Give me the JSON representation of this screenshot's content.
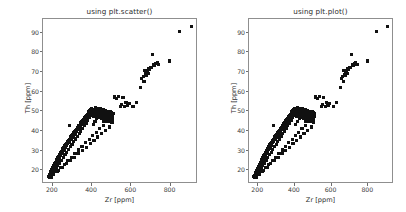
{
  "figure": {
    "background_color": "#ffffff",
    "width": 406,
    "height": 212
  },
  "panels": [
    {
      "id": "left",
      "title": "using plt.scatter()",
      "xlabel": "Zr [ppm]",
      "ylabel": "Th [ppm]"
    },
    {
      "id": "right",
      "title": "using plt.plot()",
      "xlabel": "Zr [ppm]",
      "ylabel": "Th [ppm]"
    }
  ],
  "chart_data": {
    "type": "scatter",
    "title": "using plt.scatter()",
    "xlabel": "Zr [ppm]",
    "ylabel": "Th [ppm]",
    "xlim": [
      150,
      940
    ],
    "ylim": [
      13,
      97
    ],
    "xticks": [
      200,
      400,
      600,
      800
    ],
    "yticks": [
      20,
      30,
      40,
      50,
      60,
      70,
      80,
      90
    ],
    "grid": false,
    "legend": null,
    "marker": "square",
    "marker_color": "#111111",
    "marker_size": 3.1,
    "series": [
      {
        "name": "Th vs Zr",
        "x": [
          182,
          186,
          188,
          190,
          192,
          193,
          195,
          196,
          198,
          199,
          200,
          201,
          203,
          204,
          205,
          206,
          208,
          209,
          210,
          211,
          212,
          214,
          215,
          216,
          218,
          219,
          220,
          222,
          223,
          225,
          226,
          228,
          229,
          231,
          232,
          234,
          235,
          237,
          238,
          240,
          242,
          243,
          245,
          246,
          248,
          250,
          251,
          253,
          255,
          256,
          258,
          260,
          262,
          263,
          265,
          267,
          269,
          270,
          272,
          274,
          276,
          278,
          280,
          282,
          284,
          286,
          288,
          290,
          291,
          293,
          295,
          297,
          299,
          301,
          303,
          305,
          307,
          309,
          311,
          313,
          315,
          317,
          319,
          321,
          323,
          325,
          327,
          329,
          331,
          333,
          335,
          337,
          339,
          341,
          343,
          345,
          347,
          349,
          351,
          353,
          355,
          357,
          359,
          361,
          363,
          365,
          367,
          369,
          371,
          373,
          375,
          377,
          379,
          381,
          383,
          385,
          387,
          389,
          391,
          393,
          395,
          397,
          399,
          401,
          403,
          405,
          407,
          409,
          411,
          413,
          415,
          417,
          419,
          421,
          423,
          425,
          427,
          429,
          431,
          433,
          435,
          437,
          439,
          441,
          443,
          445,
          447,
          449,
          451,
          453,
          455,
          457,
          459,
          461,
          463,
          465,
          467,
          469,
          471,
          473,
          475,
          477,
          479,
          481,
          483,
          485,
          487,
          489,
          491,
          493,
          495,
          497,
          499,
          501,
          503,
          505,
          507,
          509,
          511,
          513,
          196,
          205,
          214,
          222,
          231,
          240,
          249,
          258,
          267,
          276,
          285,
          294,
          303,
          312,
          321,
          330,
          339,
          348,
          357,
          366,
          375,
          384,
          393,
          402,
          411,
          420,
          429,
          438,
          447,
          456,
          465,
          474,
          483,
          492,
          501,
          210,
          228,
          246,
          264,
          282,
          300,
          318,
          336,
          354,
          372,
          390,
          408,
          426,
          444,
          462,
          480,
          498,
          235,
          255,
          275,
          295,
          315,
          335,
          355,
          375,
          395,
          415,
          435,
          455,
          475,
          495,
          290,
          519,
          530,
          541,
          548,
          556,
          563,
          571,
          578,
          586,
          596,
          614,
          631,
          652,
          659,
          667,
          670,
          673,
          676,
          679,
          682,
          686,
          690,
          694,
          698,
          702,
          706,
          712,
          718,
          724,
          731,
          737,
          744,
          800,
          850,
          912
        ],
        "y": [
          16.2,
          16.8,
          15.9,
          17.4,
          16.5,
          18.1,
          17.0,
          18.6,
          17.8,
          19.2,
          18.4,
          19.8,
          18.9,
          20.3,
          19.5,
          20.9,
          20.1,
          21.4,
          20.6,
          22.0,
          21.2,
          22.5,
          21.8,
          23.1,
          22.3,
          23.6,
          22.9,
          24.2,
          23.4,
          24.7,
          24.0,
          25.3,
          24.5,
          25.8,
          25.1,
          26.4,
          25.6,
          27.0,
          26.2,
          27.5,
          26.8,
          28.1,
          27.3,
          28.6,
          27.9,
          29.2,
          28.4,
          29.7,
          29.0,
          30.3,
          29.5,
          30.8,
          30.1,
          31.4,
          30.6,
          32.0,
          31.2,
          32.5,
          31.8,
          33.1,
          32.3,
          33.6,
          32.9,
          34.2,
          33.4,
          34.7,
          34.0,
          35.3,
          34.5,
          35.8,
          35.1,
          36.4,
          35.6,
          37.0,
          36.2,
          37.5,
          36.8,
          38.1,
          37.3,
          38.6,
          37.9,
          39.2,
          38.4,
          39.7,
          39.0,
          40.3,
          39.5,
          40.8,
          40.1,
          41.4,
          40.6,
          42.0,
          41.2,
          42.5,
          41.8,
          43.1,
          42.3,
          43.6,
          42.9,
          44.2,
          43.4,
          44.7,
          44.0,
          45.3,
          44.5,
          45.8,
          45.1,
          46.4,
          45.6,
          47.0,
          46.2,
          47.5,
          46.8,
          48.1,
          47.3,
          48.6,
          47.9,
          49.2,
          48.4,
          49.7,
          49.0,
          50.3,
          49.5,
          50.8,
          48.2,
          49.4,
          50.1,
          47.6,
          48.8,
          50.6,
          46.9,
          48.3,
          49.9,
          51.2,
          47.4,
          48.9,
          50.4,
          46.6,
          48.0,
          49.6,
          51.0,
          47.1,
          48.5,
          50.0,
          46.3,
          47.8,
          49.3,
          50.9,
          46.0,
          47.5,
          49.0,
          50.5,
          45.7,
          47.2,
          48.7,
          50.2,
          45.4,
          46.9,
          48.4,
          49.9,
          45.1,
          46.6,
          48.1,
          49.6,
          44.8,
          46.3,
          47.8,
          49.3,
          44.5,
          46.0,
          47.5,
          49.0,
          44.2,
          45.7,
          47.2,
          48.7,
          43.9,
          45.4,
          46.9,
          48.4,
          15.8,
          17.6,
          19.1,
          20.4,
          21.9,
          23.2,
          24.6,
          26.0,
          27.3,
          28.7,
          30.0,
          31.4,
          32.7,
          34.1,
          35.4,
          36.8,
          38.1,
          39.5,
          40.8,
          42.2,
          43.5,
          44.9,
          46.2,
          47.6,
          43.0,
          44.4,
          45.7,
          47.1,
          48.4,
          49.8,
          44.1,
          45.5,
          46.8,
          48.2,
          49.5,
          17.2,
          19.0,
          20.8,
          22.6,
          24.4,
          26.2,
          28.0,
          29.8,
          31.6,
          33.4,
          35.2,
          37.0,
          38.8,
          40.6,
          42.4,
          44.2,
          46.0,
          19.4,
          21.1,
          22.8,
          24.5,
          26.2,
          27.9,
          29.6,
          31.3,
          33.0,
          34.7,
          36.4,
          38.1,
          39.8,
          41.5,
          42.1,
          56.8,
          55.9,
          57.2,
          52.0,
          53.1,
          56.4,
          51.8,
          54.0,
          52.3,
          53.6,
          52.1,
          53.9,
          61.6,
          66.3,
          67.0,
          64.9,
          70.5,
          68.2,
          69.4,
          67.8,
          70.1,
          68.9,
          71.3,
          70.7,
          72.0,
          71.6,
          78.6,
          73.2,
          72.8,
          73.9,
          74.5,
          73.5,
          75.1,
          90.2,
          92.8
        ]
      }
    ]
  }
}
